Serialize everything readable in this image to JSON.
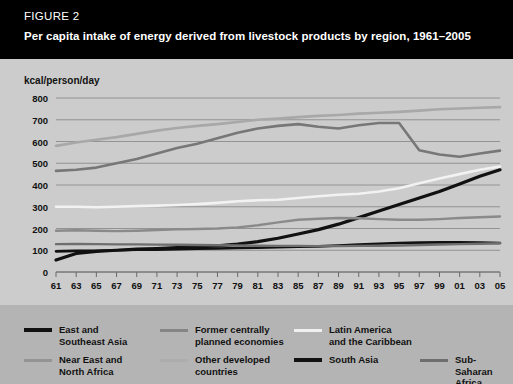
{
  "header": {
    "figure_label": "FIGURE 2",
    "title": "Per capita intake of energy derived from livestock products by region, 1961–2005"
  },
  "chart_data": {
    "type": "line",
    "title": "Per capita intake of energy derived from livestock products by region, 1961–2005",
    "xlabel": "",
    "ylabel": "kcal/person/day",
    "ylim": [
      0,
      800
    ],
    "yticks": [
      0,
      100,
      200,
      300,
      400,
      500,
      600,
      700,
      800
    ],
    "xlim": [
      1961,
      2005
    ],
    "xticks": [
      "61",
      "63",
      "65",
      "67",
      "69",
      "71",
      "73",
      "75",
      "77",
      "79",
      "81",
      "83",
      "85",
      "87",
      "89",
      "91",
      "93",
      "95",
      "97",
      "99",
      "01",
      "03",
      "05"
    ],
    "x": [
      1961,
      1963,
      1965,
      1967,
      1969,
      1971,
      1973,
      1975,
      1977,
      1979,
      1981,
      1983,
      1985,
      1987,
      1989,
      1991,
      1993,
      1995,
      1997,
      1999,
      2001,
      2003,
      2005
    ],
    "grid": true,
    "legend_position": "below",
    "series": [
      {
        "name": "East and Southeast Asia",
        "color": "#111111",
        "width": 3.2,
        "values": [
          55,
          85,
          95,
          100,
          105,
          108,
          112,
          115,
          120,
          128,
          140,
          155,
          175,
          195,
          220,
          250,
          280,
          310,
          340,
          370,
          405,
          440,
          470
        ]
      },
      {
        "name": "Near East and North Africa",
        "color": "#8a8a8a",
        "width": 2.4,
        "values": [
          190,
          192,
          190,
          188,
          190,
          193,
          196,
          198,
          200,
          205,
          215,
          228,
          240,
          245,
          248,
          247,
          243,
          240,
          240,
          243,
          248,
          252,
          255
        ]
      },
      {
        "name": "Former centrally planned economies",
        "color": "#777777",
        "width": 2.6,
        "values": [
          465,
          470,
          480,
          500,
          520,
          545,
          570,
          590,
          615,
          640,
          660,
          672,
          680,
          668,
          660,
          675,
          685,
          685,
          560,
          540,
          530,
          545,
          558
        ]
      },
      {
        "name": "Other developed countries",
        "color": "#a8a8a8",
        "width": 2.6,
        "values": [
          580,
          595,
          608,
          620,
          635,
          650,
          662,
          672,
          680,
          690,
          700,
          705,
          712,
          718,
          722,
          728,
          732,
          736,
          742,
          748,
          752,
          755,
          758
        ]
      },
      {
        "name": "Latin America and the Caribbean",
        "color": "#f2f2f2",
        "width": 2.6,
        "values": [
          300,
          300,
          298,
          300,
          303,
          305,
          308,
          312,
          318,
          325,
          330,
          332,
          340,
          348,
          355,
          360,
          370,
          385,
          408,
          430,
          450,
          470,
          485
        ]
      },
      {
        "name": "South Asia",
        "color": "#111111",
        "width": 2.6,
        "values": [
          95,
          97,
          98,
          100,
          102,
          103,
          105,
          107,
          108,
          110,
          112,
          114,
          116,
          118,
          122,
          126,
          130,
          133,
          135,
          136,
          136,
          135,
          133
        ]
      },
      {
        "name": "Sub-Saharan Africa",
        "color": "#6e6e6e",
        "width": 2.4,
        "values": [
          128,
          129,
          128,
          127,
          127,
          126,
          125,
          124,
          123,
          122,
          121,
          120,
          120,
          119,
          119,
          120,
          121,
          122,
          124,
          126,
          128,
          130,
          132
        ]
      }
    ]
  },
  "legend": {
    "items": [
      {
        "label": "East and\nSoutheast Asia",
        "color": "#111111",
        "thick": true
      },
      {
        "label": "Former centrally\nplanned economies",
        "color": "#858585",
        "thick": false
      },
      {
        "label": "Latin America\nand the Caribbean",
        "color": "#f0f0f0",
        "thick": false
      },
      {
        "label": "Near East and\nNorth Africa",
        "color": "#949494",
        "thick": false
      },
      {
        "label": "Other developed\ncountries",
        "color": "#adadad",
        "thick": false
      },
      {
        "label": "South Asia",
        "color": "#111111",
        "thick": true
      },
      {
        "label": "Sub-Saharan\nAfrica",
        "color": "#6e6e6e",
        "thick": false
      }
    ]
  }
}
